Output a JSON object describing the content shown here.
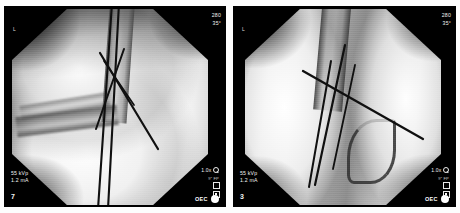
{
  "viewer": {
    "modality": "fluoroscopy",
    "layout": "dual-image-compare",
    "background_color": "#ffffff",
    "panel_color": "#000000"
  },
  "panels": [
    {
      "id": "left",
      "frame_number": "7",
      "technique": "55 kVp\n1.2 mA",
      "kvp": "55 kVp",
      "ma": "1.2 mA",
      "orientation_top_right": "280\n35°",
      "magnification": "1.0x",
      "fov_label": "9″ FP",
      "side_marker": "L",
      "vendor": "OEC",
      "anatomy": "elbow lateral with crossed K-wires",
      "field_shape": "octagon"
    },
    {
      "id": "right",
      "frame_number": "3",
      "technique": "55 kVp\n1.2 mA",
      "kvp": "55 kVp",
      "ma": "1.2 mA",
      "orientation_top_right": "280\n35°",
      "magnification": "1.0x",
      "fov_label": "9″ FP",
      "side_marker": "L",
      "vendor": "OEC",
      "anatomy": "elbow AP with crossed K-wires",
      "field_shape": "octagon"
    }
  ],
  "icons": {
    "magnifier": "magnifier-icon",
    "save": "save-icon",
    "select": "select-icon",
    "vendor_dot": "vendor-dot-icon"
  }
}
